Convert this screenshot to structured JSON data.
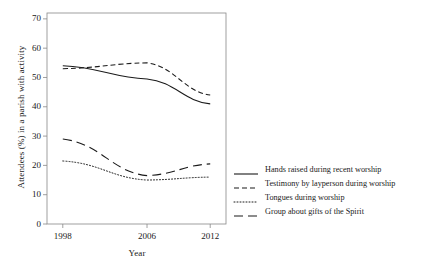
{
  "chart_data": {
    "type": "line",
    "title": "",
    "xlabel": "Year",
    "ylabel": "Attendees (%) in a parish with activity",
    "x": [
      1998,
      2006,
      2012
    ],
    "xtick_labels": [
      "1998",
      "2006",
      "2012"
    ],
    "ytick_labels": [
      "0",
      "10",
      "20",
      "30",
      "40",
      "50",
      "60",
      "70"
    ],
    "yticks": [
      0,
      10,
      20,
      30,
      40,
      50,
      60,
      70
    ],
    "ylim": [
      0,
      72
    ],
    "xlim": [
      1996.5,
      2013.5
    ],
    "grid": false,
    "legend_position": "right",
    "series": [
      {
        "name": "Hands raised during recent worship",
        "values": [
          54,
          49.5,
          41
        ],
        "style": "solid",
        "color": "#1a1a1a"
      },
      {
        "name": "Testimony by layperson during worship",
        "values": [
          53,
          55,
          44
        ],
        "style": "dashed",
        "color": "#1a1a1a"
      },
      {
        "name": "Tongues during worship",
        "values": [
          21.5,
          15,
          16
        ],
        "style": "dotted",
        "color": "#1a1a1a"
      },
      {
        "name": "Group about gifts of the Spirit",
        "values": [
          29,
          16.5,
          20.5
        ],
        "style": "long-dash",
        "color": "#1a1a1a"
      }
    ]
  },
  "axes": {
    "y_title": "Attendees (%) in a parish with activity",
    "x_title": "Year"
  },
  "legend": {
    "entries": [
      {
        "label": "Hands raised during recent worship"
      },
      {
        "label": "Testimony by layperson during worship"
      },
      {
        "label": "Tongues during worship"
      },
      {
        "label": "Group about gifts of the Spirit"
      }
    ]
  },
  "colors": {
    "line": "#1a1a1a",
    "axis": "#888888",
    "background": "#ffffff"
  }
}
